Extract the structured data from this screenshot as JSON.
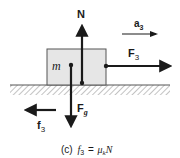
{
  "diagram": {
    "caption_prefix": "(c)",
    "caption_lhs": "f",
    "caption_lhs_sub": "3",
    "caption_eq": "=",
    "caption_mu": "μ",
    "caption_mu_sub": "k",
    "caption_rhs": "N",
    "mass_label": "m",
    "forces": {
      "normal": {
        "label": "N"
      },
      "gravity": {
        "label": "F",
        "sub": "g"
      },
      "applied": {
        "label": "F",
        "sub": "3"
      },
      "friction": {
        "label": "f",
        "sub": "3"
      }
    },
    "acceleration": {
      "label": "a",
      "sub": "3"
    },
    "colors": {
      "ink": "#1a1a1a",
      "block_fill": "#e6e6e6",
      "block_stroke": "#555555",
      "hatch": "#777777"
    }
  }
}
